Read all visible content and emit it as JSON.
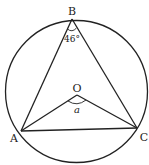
{
  "diagram": {
    "type": "circle-geometry",
    "circle": {
      "cx": 76.5,
      "cy": 91.5,
      "r": 71
    },
    "points": {
      "A": {
        "label": "A",
        "x": 21,
        "y": 131
      },
      "B": {
        "label": "B",
        "x": 72,
        "y": 19
      },
      "C": {
        "label": "C",
        "x": 137,
        "y": 128
      },
      "O": {
        "label": "O",
        "x": 77,
        "y": 95
      }
    },
    "angles": {
      "ABC": {
        "label": "46°",
        "vertex": "B"
      },
      "AOC": {
        "label": "a",
        "vertex": "O"
      }
    },
    "colors": {
      "stroke": "#222222",
      "background": "#ffffff"
    }
  }
}
